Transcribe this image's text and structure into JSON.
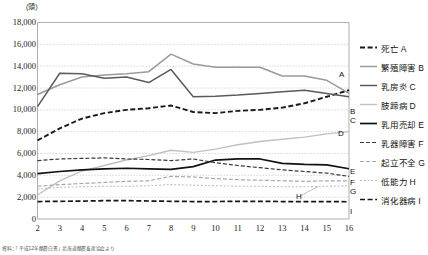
{
  "chart_data": {
    "type": "line",
    "title": "",
    "xlabel": "",
    "ylabel": "(頭)",
    "unit_note": "(頭)",
    "x": [
      2,
      3,
      4,
      5,
      6,
      7,
      8,
      9,
      10,
      11,
      12,
      13,
      14,
      15,
      16
    ],
    "xtick_labels": [
      "2",
      "3",
      "4",
      "5",
      "6",
      "7",
      "8",
      "9",
      "10",
      "11",
      "12",
      "13",
      "14",
      "15",
      "16"
    ],
    "ytick_labels": [
      "0",
      "2,000",
      "4,000",
      "6,000",
      "8,000",
      "10,000",
      "12,000",
      "14,000",
      "16,000",
      "18,000"
    ],
    "ytick_values": [
      0,
      2000,
      4000,
      6000,
      8000,
      10000,
      12000,
      14000,
      16000,
      18000
    ],
    "ylim": [
      0,
      18000
    ],
    "xlim": [
      2,
      16
    ],
    "grid": true,
    "legend_position": "right",
    "series": [
      {
        "key": "A",
        "name": "死亡 A",
        "end_label": "A",
        "style": "dashed-bold",
        "color": "#1a1a1a",
        "width": 1.9,
        "dash": "5,2.6",
        "values": [
          7200,
          8300,
          9200,
          9700,
          10000,
          10150,
          10400,
          9800,
          9700,
          9900,
          10000,
          10200,
          10600,
          11200,
          11800
        ]
      },
      {
        "key": "B",
        "name": "繁殖障害 B",
        "end_label": "B",
        "style": "solid",
        "color": "#9a9a9a",
        "width": 1.5,
        "dash": "",
        "values": [
          11400,
          12300,
          13000,
          13200,
          13300,
          13500,
          15100,
          14200,
          13900,
          13900,
          13900,
          13100,
          13100,
          12700,
          11500
        ]
      },
      {
        "key": "C",
        "name": "乳房炎 C",
        "end_label": "C",
        "style": "solid",
        "color": "#5a5a5a",
        "width": 1.5,
        "dash": "",
        "values": [
          10300,
          13350,
          13300,
          12900,
          13000,
          12500,
          13700,
          11200,
          11250,
          11350,
          11500,
          11650,
          11800,
          11500,
          11200
        ]
      },
      {
        "key": "D",
        "name": "肢蹄病 D",
        "end_label": "D",
        "style": "solid",
        "color": "#c0c0c0",
        "width": 1.4,
        "dash": "",
        "values": [
          2200,
          3500,
          4400,
          4900,
          5400,
          5800,
          6300,
          6100,
          6400,
          6800,
          7100,
          7300,
          7500,
          7800,
          8000
        ]
      },
      {
        "key": "E",
        "name": "乳用売却 E",
        "end_label": "E",
        "style": "solid-bold",
        "color": "#111111",
        "width": 1.7,
        "dash": "",
        "values": [
          4150,
          4350,
          4500,
          4600,
          4650,
          4600,
          4550,
          4800,
          5400,
          5500,
          5500,
          5100,
          5000,
          4950,
          4600
        ]
      },
      {
        "key": "F",
        "name": "乳器障害 F",
        "end_label": "F",
        "style": "dashed",
        "color": "#3a3a3a",
        "width": 1.2,
        "dash": "4,2",
        "values": [
          5350,
          5500,
          5550,
          5600,
          5500,
          5450,
          5350,
          5500,
          5150,
          4900,
          4700,
          4500,
          4350,
          4200,
          3900
        ]
      },
      {
        "key": "G",
        "name": "起立不全 G",
        "end_label": "G",
        "style": "dashed-light",
        "color": "#a8a8a8",
        "width": 1.2,
        "dash": "4,2",
        "values": [
          3000,
          3150,
          3250,
          3350,
          3450,
          3500,
          3900,
          3850,
          3700,
          3600,
          3550,
          3500,
          3450,
          3500,
          3500
        ]
      },
      {
        "key": "H",
        "name": "低能力 H",
        "end_label": "H",
        "style": "dotted-light",
        "color": "#bdbdbd",
        "width": 1.1,
        "dash": "2,1.8",
        "values": [
          2750,
          2900,
          2950,
          3000,
          3000,
          3050,
          3150,
          3100,
          3050,
          3000,
          3000,
          2950,
          2950,
          3000,
          3050
        ]
      },
      {
        "key": "I",
        "name": "消化器病 I",
        "end_label": "I",
        "style": "dashed-bold",
        "color": "#161616",
        "width": 1.7,
        "dash": "5,2.6",
        "values": [
          1600,
          1620,
          1640,
          1680,
          1680,
          1650,
          1620,
          1600,
          1600,
          1620,
          1620,
          1600,
          1600,
          1600,
          1580
        ]
      }
    ]
  },
  "legend": {
    "items": [
      {
        "label": "死亡 A"
      },
      {
        "label": "繁殖障害 B"
      },
      {
        "label": "乳房炎 C"
      },
      {
        "label": "肢蹄病 D"
      },
      {
        "label": "乳用売却 E"
      },
      {
        "label": "乳器障害 F"
      },
      {
        "label": "起立不全 G"
      },
      {
        "label": "低能力 H"
      },
      {
        "label": "消化器病 I"
      }
    ]
  },
  "footnote": {
    "text": "資料：「平成12年酪農白書」北海道酪農畜産協会より"
  }
}
